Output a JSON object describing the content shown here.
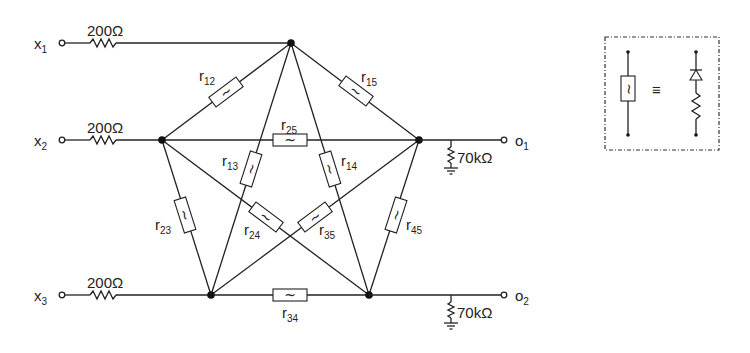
{
  "diagram": {
    "type": "resistive network with nonlinear elements",
    "inputs": [
      {
        "id": "x1",
        "label": "x",
        "sub": "1",
        "series_resistor": "200Ω"
      },
      {
        "id": "x2",
        "label": "x",
        "sub": "2",
        "series_resistor": "200Ω"
      },
      {
        "id": "x3",
        "label": "x",
        "sub": "3",
        "series_resistor": "200Ω"
      }
    ],
    "outputs": [
      {
        "id": "o1",
        "label": "o",
        "sub": "1",
        "load_resistor": "70kΩ"
      },
      {
        "id": "o2",
        "label": "o",
        "sub": "2",
        "load_resistor": "70kΩ"
      }
    ],
    "nodes": [
      "1",
      "2",
      "3",
      "4",
      "5"
    ],
    "elements": [
      {
        "label": "r",
        "sub": "12",
        "from": "1",
        "to": "2"
      },
      {
        "label": "r",
        "sub": "13",
        "from": "1",
        "to": "3"
      },
      {
        "label": "r",
        "sub": "14",
        "from": "1",
        "to": "4"
      },
      {
        "label": "r",
        "sub": "15",
        "from": "1",
        "to": "5"
      },
      {
        "label": "r",
        "sub": "23",
        "from": "2",
        "to": "3"
      },
      {
        "label": "r",
        "sub": "24",
        "from": "2",
        "to": "4"
      },
      {
        "label": "r",
        "sub": "25",
        "from": "2",
        "to": "5"
      },
      {
        "label": "r",
        "sub": "34",
        "from": "3",
        "to": "4"
      },
      {
        "label": "r",
        "sub": "35",
        "from": "3",
        "to": "5"
      },
      {
        "label": "r",
        "sub": "45",
        "from": "4",
        "to": "5"
      }
    ],
    "legend": {
      "left_symbol": "nonlinear-resistor",
      "equivalence": "≡",
      "right_symbol": "diode-in-series-with-resistor"
    },
    "tilde": "~"
  }
}
